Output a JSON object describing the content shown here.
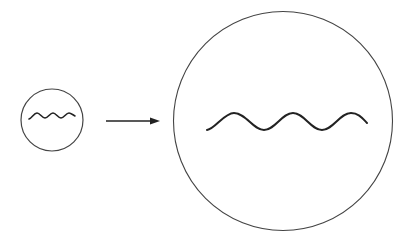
{
  "diagram": {
    "colors": {
      "stroke": "#333333",
      "background": "#ffffff"
    },
    "small_circle": {
      "cx": 52,
      "cy": 120,
      "r": 31
    },
    "arrow": {
      "x1": 106,
      "y1": 121,
      "x2": 160,
      "y2": 121
    },
    "large_circle": {
      "cx": 283,
      "cy": 121,
      "r": 109.5
    }
  }
}
